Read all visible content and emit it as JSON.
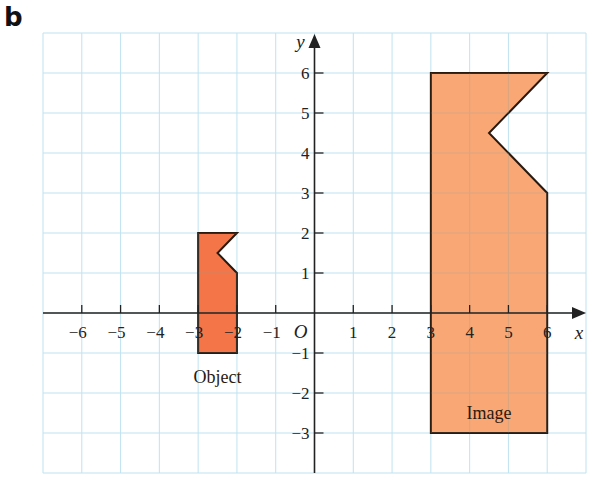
{
  "panel_label": "b",
  "chart_data": {
    "type": "coordinate-grid",
    "title": "",
    "xlabel": "x",
    "ylabel": "y",
    "origin_label": "O",
    "grid": true,
    "xlim": [
      -7,
      7
    ],
    "ylim": [
      -4,
      7
    ],
    "x_ticks": [
      -6,
      -5,
      -4,
      -3,
      -2,
      -1,
      1,
      2,
      3,
      4,
      5,
      6
    ],
    "y_ticks": [
      -3,
      -2,
      -1,
      1,
      2,
      3,
      4,
      5,
      6
    ],
    "shapes": [
      {
        "name": "Object",
        "label": "Object",
        "color": "#f26a3a",
        "points": [
          [
            -3,
            2
          ],
          [
            -2,
            2
          ],
          [
            -2.5,
            1.5
          ],
          [
            -2,
            1
          ],
          [
            -2,
            -1
          ],
          [
            -3,
            -1
          ]
        ],
        "label_pos": [
          -2.5,
          -1.6
        ]
      },
      {
        "name": "Image",
        "label": "Image",
        "color": "#f8a068",
        "points": [
          [
            3,
            6
          ],
          [
            6,
            6
          ],
          [
            4.5,
            4.5
          ],
          [
            6,
            3
          ],
          [
            6,
            -3
          ],
          [
            3,
            -3
          ]
        ],
        "label_pos": [
          4.5,
          -2.5
        ]
      }
    ]
  },
  "colors": {
    "grid": "#bfe3f0",
    "axis": "#222222",
    "outline": "#2a1a10"
  }
}
